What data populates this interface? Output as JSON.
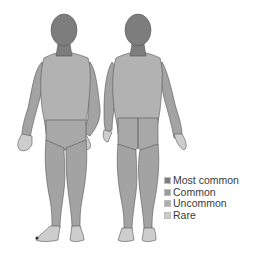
{
  "diagram": {
    "views": [
      "front",
      "back"
    ],
    "legend": {
      "items": [
        {
          "label": "Most common",
          "color": "#7d7d7d"
        },
        {
          "label": "Common",
          "color": "#9a9a9a"
        },
        {
          "label": "Uncommon",
          "color": "#aeaeae"
        },
        {
          "label": "Rare",
          "color": "#cdcdcd"
        }
      ]
    },
    "colors": {
      "head": "#7d7d7d",
      "torso": "#b2b2b2",
      "limbs": "#a3a3a3",
      "extremities": "#cdcdcd",
      "outline": "#555555"
    }
  }
}
